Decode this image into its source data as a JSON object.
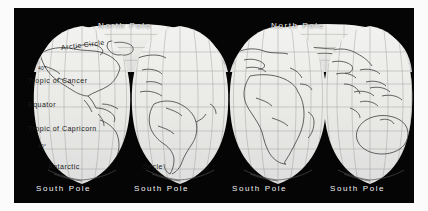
{
  "figure": {
    "kind": "map-plate",
    "plate_color": "#050505",
    "land_outline_color": "#3a3a3a",
    "graticule_color": "#9a9a9a",
    "gore_fill_color": "#e8e8e6",
    "label_color": "#f2f2f2",
    "interior_label_color": "#1a1a1a"
  },
  "labels": {
    "north_pole_1": "North Pole",
    "north_pole_2": "North Pole",
    "south_pole_1": "South Pole",
    "south_pole_2": "South Pole",
    "south_pole_3": "South Pole",
    "south_pole_4": "South Pole",
    "arctic_circle": "Arctic Circle",
    "forty_north": "40°",
    "tropic_of_cancer": "Tropic of Cancer",
    "equator": "Equator",
    "tropic_of_capricorn": "Tropic of Capricorn",
    "forty_south": "40°",
    "antarctic": "Antarctic",
    "antarctic_circle_continuation": "Circle"
  },
  "gores": [
    {
      "name": "gore-western-americas-left",
      "center_x": 68,
      "landmasses": [
        "North America",
        "Greenland"
      ]
    },
    {
      "name": "gore-western-americas-right",
      "center_x": 166,
      "landmasses": [
        "South America",
        "Caribbean"
      ]
    },
    {
      "name": "gore-eastern-africa-europe",
      "center_x": 264,
      "landmasses": [
        "Africa",
        "Europe",
        "Asia"
      ]
    },
    {
      "name": "gore-eastern-asia-australia",
      "center_x": 356,
      "landmasses": [
        "Australia",
        "Southeast Asia",
        "East Asia"
      ]
    }
  ],
  "latitude_lines": [
    {
      "name": "arctic-circle",
      "y": 44,
      "label": "Arctic Circle"
    },
    {
      "name": "forty-north",
      "y": 63,
      "label": "40°"
    },
    {
      "name": "tropic-of-cancer",
      "y": 76,
      "label": "Tropic of Cancer"
    },
    {
      "name": "equator",
      "y": 99,
      "label": "Equator"
    },
    {
      "name": "tropic-of-capricorn",
      "y": 123,
      "label": "Tropic of Capricorn"
    },
    {
      "name": "forty-south",
      "y": 141,
      "label": "40°"
    },
    {
      "name": "antarctic-circle",
      "y": 161,
      "label": "Antarctic Circle"
    }
  ]
}
